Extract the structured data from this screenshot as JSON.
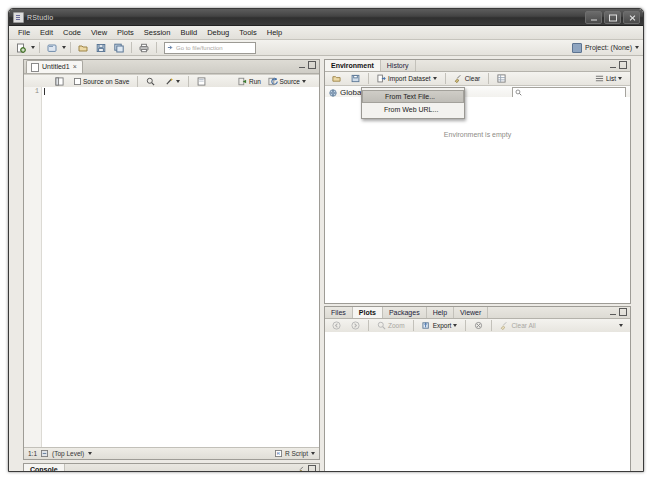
{
  "window": {
    "title": "RStudio",
    "icon": "rstudio-icon",
    "controls": {
      "minimize": "–",
      "maximize": "□",
      "close": "✕"
    }
  },
  "menubar": {
    "items": [
      "File",
      "Edit",
      "Code",
      "View",
      "Plots",
      "Session",
      "Build",
      "Debug",
      "Tools",
      "Help"
    ]
  },
  "toolbar": {
    "buttons": [
      {
        "name": "new-file-icon",
        "label": ""
      },
      {
        "name": "new-project-icon",
        "label": ""
      },
      {
        "name": "open-file-icon",
        "label": ""
      },
      {
        "name": "save-icon",
        "label": ""
      },
      {
        "name": "save-all-icon",
        "label": ""
      },
      {
        "name": "print-icon",
        "label": ""
      }
    ],
    "goto": {
      "placeholder": "Go to file/function",
      "icon": "jump-to-icon"
    },
    "project": {
      "label": "Project: (None)",
      "icon": "project-icon"
    }
  },
  "source": {
    "tab": {
      "label": "Untitled1",
      "close": "×",
      "icon": "document-icon"
    },
    "toolbar": {
      "show_doc_outline": "",
      "source_on_save_label": "Source on Save",
      "find_icon": "magnifier-icon",
      "code_tools_icon": "wand-icon",
      "compile_report_icon": "compile-report-icon",
      "run_label": "Run",
      "rerun_label": "",
      "source_label": "Source"
    },
    "gutter_lines": [
      "1"
    ],
    "code": "",
    "status": {
      "cursor": "1:1",
      "scope": "(Top Level)",
      "scope_icon": "scope-icon",
      "file_type": "R Script"
    }
  },
  "console": {
    "tab": "Console",
    "controls": {
      "clear_icon": "broom-icon",
      "maximize_icon": "maximize-icon"
    }
  },
  "environment": {
    "tabs": [
      {
        "label": "Environment",
        "active": true
      },
      {
        "label": "History",
        "active": false
      }
    ],
    "toolbar": {
      "load_icon": "open-workspace-icon",
      "save_icon": "save-workspace-icon",
      "import_label": "Import Dataset",
      "clear_label": "Clear",
      "clear_icon": "broom-icon",
      "grid_icon": "grid-view-icon",
      "list_label": "List"
    },
    "scope": {
      "label": "Global",
      "icon": "globe-icon"
    },
    "search_placeholder": "",
    "empty_message": "Environment is empty"
  },
  "import_menu": {
    "items": [
      {
        "label": "From Text File...",
        "hovered": true
      },
      {
        "label": "From Web URL...",
        "hovered": false
      }
    ]
  },
  "files_pane": {
    "tabs": [
      {
        "label": "Files",
        "active": false
      },
      {
        "label": "Plots",
        "active": true
      },
      {
        "label": "Packages",
        "active": false
      },
      {
        "label": "Help",
        "active": false
      },
      {
        "label": "Viewer",
        "active": false
      }
    ],
    "toolbar": {
      "back_icon": "back-arrow-icon",
      "forward_icon": "forward-arrow-icon",
      "zoom_label": "Zoom",
      "zoom_icon": "magnifier-icon",
      "export_label": "Export",
      "export_icon": "export-icon",
      "remove_icon": "remove-plot-icon",
      "clear_all_label": "Clear All",
      "clear_all_icon": "broom-icon"
    }
  },
  "colors": {
    "accent": "#4a6f9c",
    "chrome": "#eceae5",
    "titlebar": "#3b3b3b",
    "pane_border": "#9e9c96"
  }
}
